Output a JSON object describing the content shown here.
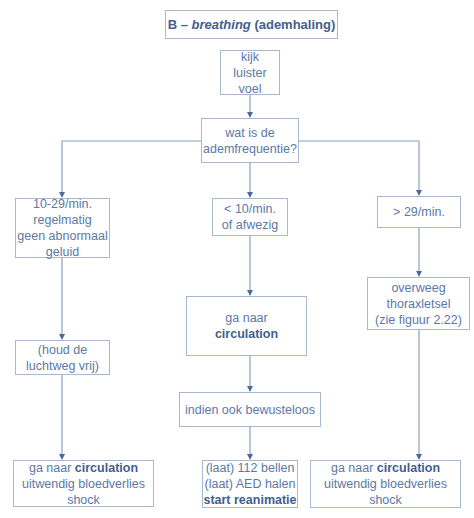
{
  "title": {
    "letter": "B – ",
    "italic": "breathing",
    "rest": " (ademhaling)"
  },
  "nodes": {
    "assess": [
      "kijk",
      "luister",
      "voel"
    ],
    "question": [
      "wat is de",
      "ademfrequentie?"
    ],
    "left_rate": [
      "10-29/min.",
      "regelmatig",
      "geen abnormaal",
      "geluid"
    ],
    "mid_rate": [
      "< 10/min.",
      "of afwezig"
    ],
    "right_rate": [
      "> 29/min."
    ],
    "left_airway": [
      "(houd de",
      "luchtweg vrij)"
    ],
    "mid_goto": {
      "line1": "ga naar",
      "bold": "circulation"
    },
    "right_thorax": [
      "overweeg",
      "thoraxletsel",
      "(zie figuur 2.22)"
    ],
    "mid_unconscious": "indien ook bewusteloos",
    "left_end": {
      "prefix": "ga naar ",
      "bold": "circulation",
      "line2": "uitwendig bloedverlies",
      "line3": "shock"
    },
    "mid_end": {
      "line1": "(laat) 112 bellen",
      "line2": "(laat) AED halen",
      "bold": "start reanimatie"
    },
    "right_end": {
      "prefix": "ga naar ",
      "bold": "circulation",
      "line2": "uitwendig bloedverlies",
      "line3": "shock"
    }
  },
  "colors": {
    "text": "#5b79a6",
    "bold_text": "#3f5f8f",
    "border": "#a9b8d1",
    "line": "#8aa0c4"
  }
}
